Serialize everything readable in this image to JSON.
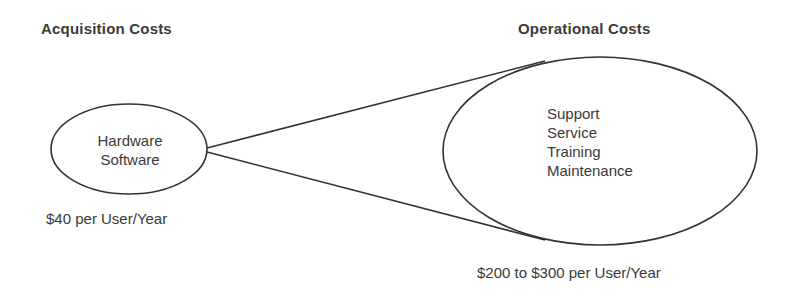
{
  "diagram": {
    "acquisition": {
      "heading": "Acquisition Costs",
      "items": [
        "Hardware",
        "Software"
      ],
      "cost": "$40 per User/Year"
    },
    "operational": {
      "heading": "Operational Costs",
      "items": [
        "Support",
        "Service",
        "Training",
        "Maintenance"
      ],
      "cost": "$200 to $300 per User/Year"
    },
    "colors": {
      "stroke": "#333333",
      "text": "#3a3a3a",
      "background": "#ffffff"
    }
  }
}
